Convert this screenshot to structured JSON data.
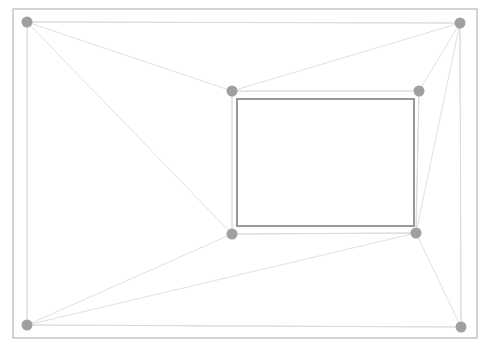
{
  "canvas": {
    "width": 489,
    "height": 350,
    "background": "#ffffff",
    "title": "perspective-mesh-overlay"
  },
  "palette": {
    "outer_frame_stroke": "#b8b8b8",
    "inner_document_stroke": "#8e8e8e",
    "quad_stroke": "#dcdcdc",
    "edge_stroke": "#e0e0e0",
    "node_fill": "#a0a0a0",
    "background": "#ffffff"
  },
  "strokes": {
    "outer_frame_width": 1.2,
    "inner_document_width": 1.8,
    "quad_width": 1.0,
    "edge_width": 1.0
  },
  "outer_frame": {
    "label": "outer-page-border",
    "x": 13,
    "y": 9,
    "width": 464,
    "height": 329
  },
  "inner_document": {
    "label": "inner-document-border",
    "x": 237,
    "y": 99,
    "width": 177,
    "height": 127
  },
  "nodes": [
    {
      "id": "corner-top-left",
      "name": "node-corner-top-left",
      "x": 27,
      "y": 22,
      "r": 5.5
    },
    {
      "id": "corner-top-right",
      "name": "node-corner-top-right",
      "x": 460,
      "y": 23,
      "r": 5.5
    },
    {
      "id": "corner-bottom-right",
      "name": "node-corner-bottom-right",
      "x": 461,
      "y": 327,
      "r": 5.5
    },
    {
      "id": "corner-bottom-left",
      "name": "node-corner-bottom-left",
      "x": 27,
      "y": 325,
      "r": 5.5
    },
    {
      "id": "inner-top-left",
      "name": "node-inner-top-left",
      "x": 232,
      "y": 91,
      "r": 5.5
    },
    {
      "id": "inner-top-right",
      "name": "node-inner-top-right",
      "x": 419,
      "y": 91,
      "r": 5.5
    },
    {
      "id": "inner-bottom-right",
      "name": "node-inner-bottom-right",
      "x": 416,
      "y": 233,
      "r": 5.5
    },
    {
      "id": "inner-bottom-left",
      "name": "node-inner-bottom-left",
      "x": 232,
      "y": 234,
      "r": 5.5
    }
  ],
  "quads": [
    {
      "id": "outer-quad",
      "name": "outer-quadrilateral",
      "points": "27,22 460,23 461,327 27,325",
      "closed": true
    },
    {
      "id": "inner-quad",
      "name": "inner-quadrilateral",
      "points": "232,91 419,91 416,233 232,234",
      "closed": true
    }
  ],
  "edges": [
    {
      "id": "e1",
      "name": "edge-tl-to-inner-tl",
      "x1": 27,
      "y1": 22,
      "x2": 232,
      "y2": 91
    },
    {
      "id": "e2",
      "name": "edge-tl-to-inner-bl",
      "x1": 27,
      "y1": 22,
      "x2": 232,
      "y2": 234
    },
    {
      "id": "e3",
      "name": "edge-tl-to-tr",
      "x1": 27,
      "y1": 22,
      "x2": 460,
      "y2": 23
    },
    {
      "id": "e4",
      "name": "edge-tr-to-inner-tl",
      "x1": 460,
      "y1": 23,
      "x2": 232,
      "y2": 91
    },
    {
      "id": "e5",
      "name": "edge-tr-to-inner-tr",
      "x1": 460,
      "y1": 23,
      "x2": 419,
      "y2": 91
    },
    {
      "id": "e6",
      "name": "edge-tr-to-inner-br",
      "x1": 460,
      "y1": 23,
      "x2": 416,
      "y2": 233
    },
    {
      "id": "e7",
      "name": "edge-br-to-inner-br",
      "x1": 461,
      "y1": 327,
      "x2": 416,
      "y2": 233
    },
    {
      "id": "e8",
      "name": "edge-bl-to-inner-bl",
      "x1": 27,
      "y1": 325,
      "x2": 232,
      "y2": 234
    },
    {
      "id": "e9",
      "name": "edge-bl-to-inner-br",
      "x1": 27,
      "y1": 325,
      "x2": 416,
      "y2": 233
    },
    {
      "id": "e10",
      "name": "edge-bl-to-br",
      "x1": 27,
      "y1": 325,
      "x2": 461,
      "y2": 327
    },
    {
      "id": "e11",
      "name": "edge-tl-to-bl",
      "x1": 27,
      "y1": 22,
      "x2": 27,
      "y2": 325
    },
    {
      "id": "e12",
      "name": "edge-tr-to-br",
      "x1": 460,
      "y1": 23,
      "x2": 461,
      "y2": 327
    },
    {
      "id": "e13",
      "name": "edge-inner-tl-to-bl",
      "x1": 232,
      "y1": 91,
      "x2": 232,
      "y2": 234
    },
    {
      "id": "e14",
      "name": "edge-inner-tr-to-br",
      "x1": 419,
      "y1": 91,
      "x2": 416,
      "y2": 233
    },
    {
      "id": "e15",
      "name": "edge-inner-tl-to-tr",
      "x1": 232,
      "y1": 91,
      "x2": 419,
      "y2": 91
    },
    {
      "id": "e16",
      "name": "edge-inner-bl-to-br",
      "x1": 232,
      "y1": 234,
      "x2": 416,
      "y2": 233
    }
  ]
}
